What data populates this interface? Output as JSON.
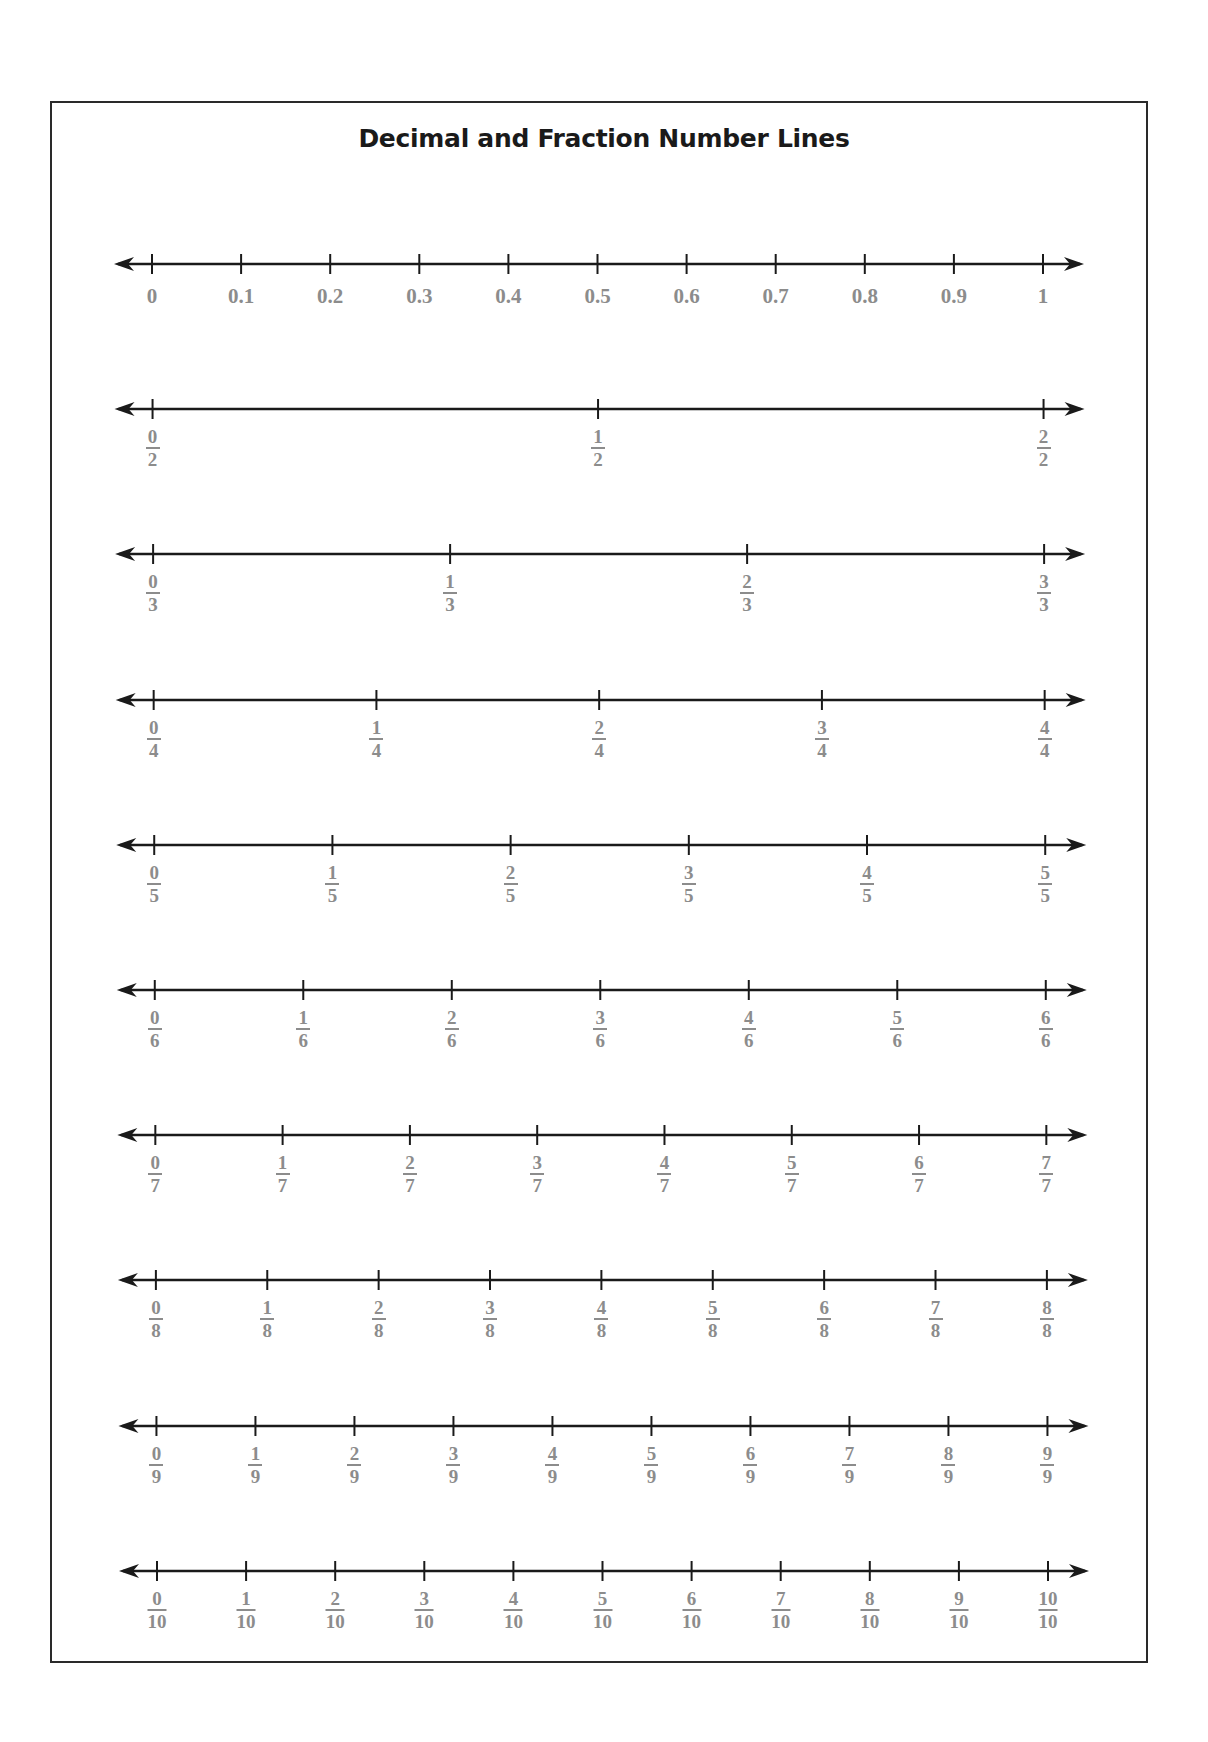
{
  "title": "Decimal and Fraction Number Lines",
  "colors": {
    "line": "#1a1a1a",
    "label": "#8c8c8c",
    "border": "#2a2a2a"
  },
  "lines": [
    {
      "kind": "decimal",
      "labels": [
        "0",
        "0.1",
        "0.2",
        "0.3",
        "0.4",
        "0.5",
        "0.6",
        "0.7",
        "0.8",
        "0.9",
        "1"
      ]
    },
    {
      "kind": "fraction",
      "denominator": "2",
      "numerators": [
        "0",
        "1",
        "2"
      ]
    },
    {
      "kind": "fraction",
      "denominator": "3",
      "numerators": [
        "0",
        "1",
        "2",
        "3"
      ]
    },
    {
      "kind": "fraction",
      "denominator": "4",
      "numerators": [
        "0",
        "1",
        "2",
        "3",
        "4"
      ]
    },
    {
      "kind": "fraction",
      "denominator": "5",
      "numerators": [
        "0",
        "1",
        "2",
        "3",
        "4",
        "5"
      ]
    },
    {
      "kind": "fraction",
      "denominator": "6",
      "numerators": [
        "0",
        "1",
        "2",
        "3",
        "4",
        "5",
        "6"
      ]
    },
    {
      "kind": "fraction",
      "denominator": "7",
      "numerators": [
        "0",
        "1",
        "2",
        "3",
        "4",
        "5",
        "6",
        "7"
      ]
    },
    {
      "kind": "fraction",
      "denominator": "8",
      "numerators": [
        "0",
        "1",
        "2",
        "3",
        "4",
        "5",
        "6",
        "7",
        "8"
      ]
    },
    {
      "kind": "fraction",
      "denominator": "9",
      "numerators": [
        "0",
        "1",
        "2",
        "3",
        "4",
        "5",
        "6",
        "7",
        "8",
        "9"
      ]
    },
    {
      "kind": "fraction",
      "denominator": "10",
      "numerators": [
        "0",
        "1",
        "2",
        "3",
        "4",
        "5",
        "6",
        "7",
        "8",
        "9",
        "10"
      ]
    }
  ]
}
